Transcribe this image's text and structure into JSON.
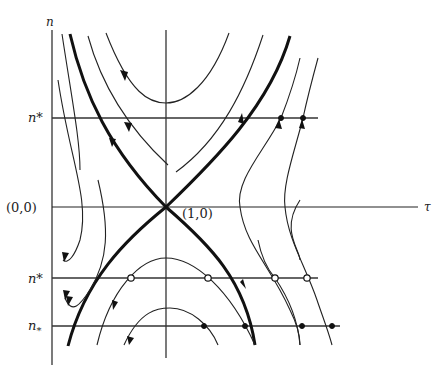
{
  "diagram": {
    "axes": {
      "y_label": "n",
      "x_label": "τ",
      "origin_label": "(0,0)",
      "saddle_label": "(1,0)"
    },
    "levels": [
      {
        "label": "n*",
        "role": "upper level",
        "y": 118
      },
      {
        "label": "n*",
        "role": "lower level (open circles)",
        "y": 278
      },
      {
        "label": "n",
        "subscript": "*",
        "role": "lowest level (filled dots)",
        "y": 326
      }
    ],
    "markers": {
      "filled_upper": [
        [
          281,
          118
        ],
        [
          303,
          118
        ]
      ],
      "open_lower": [
        [
          131,
          278
        ],
        [
          208,
          278
        ],
        [
          275,
          278
        ],
        [
          307,
          278
        ]
      ],
      "filled_lowest": [
        [
          204,
          326
        ],
        [
          245,
          326
        ],
        [
          302,
          326
        ],
        [
          332,
          326
        ]
      ]
    },
    "colors": {
      "ink": "#111111",
      "background": "#ffffff"
    }
  }
}
